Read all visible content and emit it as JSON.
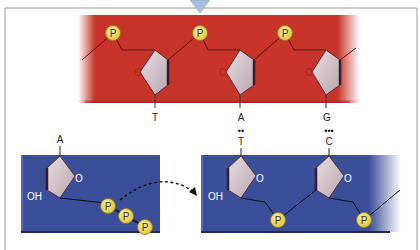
{
  "diagram": {
    "type": "DNA replication nucleotide addition",
    "colors": {
      "template_strand": "#c8342a",
      "new_strand": "#3b4e9a",
      "sugar_fill": "#d9c8cf",
      "sugar_edge": "#5a2a3a",
      "phosphate_fill": "#f0d64a",
      "phosphate_edge": "#8a7a20",
      "frame": "#9a9a9a",
      "arrow_indicator": "#a9bfe0"
    },
    "template_strand": {
      "phosphate_label": "P",
      "oxygen_label": "O",
      "bases": [
        "T",
        "A",
        "G"
      ]
    },
    "incoming_nucleotide": {
      "base": "A",
      "hydroxyl_label": "OH",
      "oxygen_label": "O",
      "phosphates": [
        "P",
        "P",
        "P"
      ]
    },
    "new_strand": {
      "hydroxyl_label": "OH",
      "oxygen_label": "O",
      "phosphate_label": "P",
      "pairs": [
        {
          "template_base": "A",
          "new_base": "T",
          "hydrogen_bonds": "••"
        },
        {
          "template_base": "G",
          "new_base": "C",
          "hydrogen_bonds": "•••"
        }
      ]
    }
  }
}
